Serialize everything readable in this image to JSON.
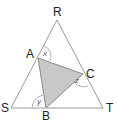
{
  "diagram": {
    "type": "geometry",
    "outer_triangle": {
      "vertices": {
        "R": {
          "label": "R",
          "x": 57,
          "y": 20
        },
        "S": {
          "label": "S",
          "x": 11,
          "y": 108
        },
        "T": {
          "label": "T",
          "x": 103,
          "y": 108
        }
      }
    },
    "inner_triangle": {
      "vertices": {
        "A": {
          "label": "A",
          "x": 38,
          "y": 58
        },
        "B": {
          "label": "B",
          "x": 46,
          "y": 108
        },
        "C": {
          "label": "C",
          "x": 83,
          "y": 74
        }
      },
      "fill": "#c8c8c8"
    },
    "angles": {
      "x": {
        "label": "x",
        "at": "A"
      },
      "y": {
        "label": "y",
        "at": "B"
      },
      "z": {
        "label": "z",
        "at": "C"
      }
    },
    "colors": {
      "line": "#9a9a9a",
      "shade": "#c8c8c8",
      "text": "#222222"
    }
  }
}
